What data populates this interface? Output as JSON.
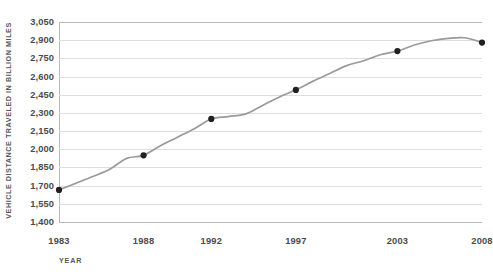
{
  "chart_data": {
    "type": "line",
    "title": "",
    "xlabel": "YEAR",
    "ylabel": "VEHICLE DISTANCE TRAVELED IN BILLION MILES",
    "xlim": [
      1983,
      2008
    ],
    "ylim": [
      1400,
      3050
    ],
    "grid": true,
    "legend": "none",
    "y_ticks": [
      "1,400",
      "1,550",
      "1,700",
      "1,850",
      "2,000",
      "2,150",
      "2,300",
      "2,450",
      "2,600",
      "2,750",
      "2,900",
      "3,050"
    ],
    "y_tick_values": [
      1400,
      1550,
      1700,
      1850,
      2000,
      2150,
      2300,
      2450,
      2600,
      2750,
      2900,
      3050
    ],
    "x_ticks": [
      "1983",
      "1988",
      "1992",
      "1997",
      "2003",
      "2008"
    ],
    "x_tick_values": [
      1983,
      1988,
      1992,
      1997,
      2003,
      2008
    ],
    "line_color": "#9a9a9c",
    "marker_color": "#231f20",
    "grid_color": "#dededf",
    "axis_color": "#b9b9ba",
    "text_color": "#4b4b4d",
    "x": [
      1983,
      1984,
      1985,
      1986,
      1987,
      1988,
      1989,
      1990,
      1991,
      1992,
      1993,
      1994,
      1995,
      1996,
      1997,
      1998,
      1999,
      2000,
      2001,
      2002,
      2003,
      2004,
      2005,
      2006,
      2007,
      2008
    ],
    "values": [
      1665,
      1720,
      1775,
      1835,
      1925,
      1950,
      2030,
      2100,
      2170,
      2250,
      2270,
      2290,
      2360,
      2430,
      2490,
      2560,
      2625,
      2690,
      2730,
      2780,
      2810,
      2860,
      2895,
      2915,
      2920,
      2880
    ],
    "marker_points": [
      {
        "x": 1983,
        "y": 1665
      },
      {
        "x": 1988,
        "y": 1950
      },
      {
        "x": 1992,
        "y": 2250
      },
      {
        "x": 1997,
        "y": 2490
      },
      {
        "x": 2003,
        "y": 2810
      },
      {
        "x": 2008,
        "y": 2880
      }
    ]
  }
}
